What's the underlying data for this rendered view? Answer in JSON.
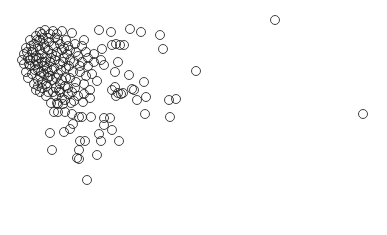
{
  "chart_data": {
    "type": "scatter",
    "title": "",
    "xlabel": "",
    "ylabel": "",
    "axes_visible": false,
    "grid": false,
    "legend": null,
    "marker": {
      "shape": "open-circle",
      "radius_px": 4.5,
      "stroke": "#222222"
    },
    "pixel_extent": {
      "width": 387,
      "height": 235
    },
    "note": "No axes or tick labels are rendered; points are given in pixel coordinates (origin top-left).",
    "points": [
      [
        275,
        20
      ],
      [
        196,
        71
      ],
      [
        363,
        114
      ],
      [
        99,
        30
      ],
      [
        111,
        32
      ],
      [
        130,
        29
      ],
      [
        141,
        32
      ],
      [
        160,
        35
      ],
      [
        163,
        49
      ],
      [
        116,
        44
      ],
      [
        120,
        45
      ],
      [
        112,
        45
      ],
      [
        124,
        45
      ],
      [
        94,
        54
      ],
      [
        102,
        49
      ],
      [
        101,
        60
      ],
      [
        104,
        65
      ],
      [
        118,
        62
      ],
      [
        115,
        72
      ],
      [
        129,
        75
      ],
      [
        144,
        82
      ],
      [
        97,
        81
      ],
      [
        112,
        90
      ],
      [
        116,
        96
      ],
      [
        121,
        94
      ],
      [
        132,
        89
      ],
      [
        137,
        100
      ],
      [
        146,
        97
      ],
      [
        169,
        100
      ],
      [
        176,
        99
      ],
      [
        145,
        114
      ],
      [
        170,
        117
      ],
      [
        115,
        87
      ],
      [
        118,
        93
      ],
      [
        123,
        93
      ],
      [
        134,
        90
      ],
      [
        51,
        103
      ],
      [
        57,
        103
      ],
      [
        63,
        104
      ],
      [
        71,
        103
      ],
      [
        74,
        101
      ],
      [
        83,
        102
      ],
      [
        54,
        112
      ],
      [
        58,
        112
      ],
      [
        65,
        112
      ],
      [
        72,
        114
      ],
      [
        50,
        133
      ],
      [
        64,
        132
      ],
      [
        70,
        129
      ],
      [
        73,
        124
      ],
      [
        79,
        117
      ],
      [
        82,
        117
      ],
      [
        91,
        117
      ],
      [
        99,
        134
      ],
      [
        104,
        118
      ],
      [
        110,
        118
      ],
      [
        104,
        125
      ],
      [
        112,
        130
      ],
      [
        80,
        141
      ],
      [
        85,
        141
      ],
      [
        101,
        141
      ],
      [
        119,
        141
      ],
      [
        52,
        150
      ],
      [
        79,
        150
      ],
      [
        77,
        158
      ],
      [
        97,
        155
      ],
      [
        79,
        159
      ],
      [
        87,
        180
      ],
      [
        53,
        31
      ],
      [
        62,
        31
      ],
      [
        72,
        33
      ],
      [
        66,
        40
      ],
      [
        58,
        40
      ],
      [
        75,
        44
      ],
      [
        82,
        46
      ],
      [
        86,
        52
      ],
      [
        78,
        56
      ],
      [
        70,
        50
      ],
      [
        62,
        50
      ],
      [
        74,
        62
      ],
      [
        82,
        62
      ],
      [
        88,
        66
      ],
      [
        80,
        72
      ],
      [
        73,
        72
      ],
      [
        66,
        78
      ],
      [
        76,
        82
      ],
      [
        84,
        84
      ],
      [
        90,
        90
      ],
      [
        68,
        88
      ],
      [
        60,
        92
      ],
      [
        56,
        96
      ],
      [
        48,
        92
      ],
      [
        42,
        88
      ],
      [
        38,
        80
      ],
      [
        26,
        48
      ],
      [
        30,
        40
      ],
      [
        36,
        36
      ],
      [
        42,
        34
      ],
      [
        48,
        38
      ],
      [
        44,
        44
      ],
      [
        38,
        46
      ],
      [
        32,
        52
      ],
      [
        28,
        58
      ],
      [
        24,
        64
      ],
      [
        30,
        66
      ],
      [
        36,
        60
      ],
      [
        42,
        54
      ],
      [
        48,
        50
      ],
      [
        54,
        46
      ],
      [
        56,
        56
      ],
      [
        50,
        62
      ],
      [
        44,
        66
      ],
      [
        38,
        70
      ],
      [
        32,
        74
      ],
      [
        40,
        76
      ],
      [
        48,
        72
      ],
      [
        54,
        68
      ],
      [
        60,
        64
      ],
      [
        64,
        58
      ],
      [
        58,
        74
      ],
      [
        52,
        80
      ],
      [
        46,
        84
      ],
      [
        60,
        84
      ],
      [
        66,
        68
      ],
      [
        70,
        60
      ],
      [
        34,
        84
      ],
      [
        28,
        78
      ],
      [
        26,
        72
      ],
      [
        34,
        44
      ],
      [
        40,
        40
      ],
      [
        46,
        58
      ],
      [
        52,
        54
      ],
      [
        36,
        56
      ],
      [
        30,
        60
      ],
      [
        44,
        74
      ],
      [
        50,
        76
      ],
      [
        56,
        88
      ],
      [
        62,
        98
      ],
      [
        68,
        94
      ],
      [
        40,
        50
      ],
      [
        42,
        62
      ],
      [
        35,
        65
      ],
      [
        45,
        48
      ],
      [
        33,
        50
      ],
      [
        38,
        64
      ],
      [
        47,
        68
      ],
      [
        55,
        60
      ],
      [
        61,
        70
      ],
      [
        65,
        86
      ],
      [
        72,
        92
      ],
      [
        78,
        96
      ],
      [
        58,
        104
      ],
      [
        46,
        96
      ],
      [
        40,
        92
      ],
      [
        36,
        90
      ],
      [
        24,
        54
      ],
      [
        22,
        60
      ],
      [
        27,
        52
      ],
      [
        31,
        46
      ],
      [
        37,
        40
      ],
      [
        43,
        38
      ],
      [
        49,
        42
      ],
      [
        55,
        38
      ],
      [
        60,
        44
      ],
      [
        64,
        48
      ],
      [
        67,
        54
      ],
      [
        52,
        70
      ],
      [
        48,
        78
      ],
      [
        42,
        82
      ],
      [
        38,
        86
      ],
      [
        56,
        78
      ],
      [
        62,
        80
      ],
      [
        70,
        78
      ],
      [
        75,
        88
      ],
      [
        84,
        94
      ],
      [
        90,
        98
      ],
      [
        86,
        76
      ],
      [
        80,
        66
      ],
      [
        76,
        52
      ],
      [
        68,
        46
      ],
      [
        57,
        34
      ],
      [
        45,
        30
      ],
      [
        40,
        32
      ],
      [
        50,
        34
      ],
      [
        33,
        58
      ],
      [
        39,
        58
      ],
      [
        45,
        62
      ],
      [
        51,
        58
      ],
      [
        57,
        52
      ],
      [
        63,
        62
      ],
      [
        69,
        66
      ],
      [
        29,
        64
      ],
      [
        35,
        70
      ],
      [
        41,
        72
      ],
      [
        47,
        86
      ],
      [
        53,
        92
      ],
      [
        59,
        90
      ],
      [
        65,
        100
      ],
      [
        92,
        74
      ],
      [
        88,
        58
      ],
      [
        94,
        62
      ],
      [
        84,
        40
      ]
    ]
  }
}
